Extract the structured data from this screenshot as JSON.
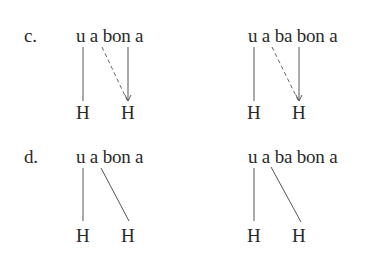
{
  "examples": [
    {
      "label": "c.",
      "left": {
        "string": "u a bon a",
        "tones": [
          "H",
          "H"
        ],
        "links": [
          "solid-association",
          "dashed-spread",
          "solid-arrow"
        ]
      },
      "right": {
        "string": "u a ba bon a",
        "tones": [
          "H",
          "H"
        ],
        "links": [
          "solid-association",
          "dashed-spread",
          "solid-arrow"
        ]
      }
    },
    {
      "label": "d.",
      "left": {
        "string": "u a bon a",
        "tones": [
          "H",
          "H"
        ],
        "links": [
          "solid-association",
          "solid-association"
        ]
      },
      "right": {
        "string": "u a ba bon a",
        "tones": [
          "H",
          "H"
        ],
        "links": [
          "solid-association",
          "solid-association"
        ]
      }
    }
  ],
  "colors": {
    "text": "#2a2a2a",
    "line": "#555555"
  }
}
